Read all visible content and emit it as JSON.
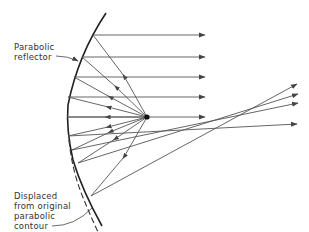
{
  "diagram": {
    "labels": {
      "reflector_line1": "Parabolic",
      "reflector_line2": "reflector",
      "displaced_line1": "Displaced",
      "displaced_line2": "from original",
      "displaced_line3": "parabolic",
      "displaced_line4": "contour"
    },
    "colors": {
      "stroke": "#555555",
      "reflector": "#222222",
      "focus": "#111111",
      "text": "#333333"
    },
    "focal_point": {
      "x": 147,
      "y": 117
    },
    "parallel_rays_y": [
      35,
      57,
      77,
      97,
      117
    ],
    "parallel_ray_end_x": 205,
    "diverging_rays_end": [
      {
        "x": 297,
        "y": 84
      },
      {
        "x": 298,
        "y": 94
      },
      {
        "x": 298,
        "y": 103
      },
      {
        "x": 297,
        "y": 124
      }
    ]
  }
}
